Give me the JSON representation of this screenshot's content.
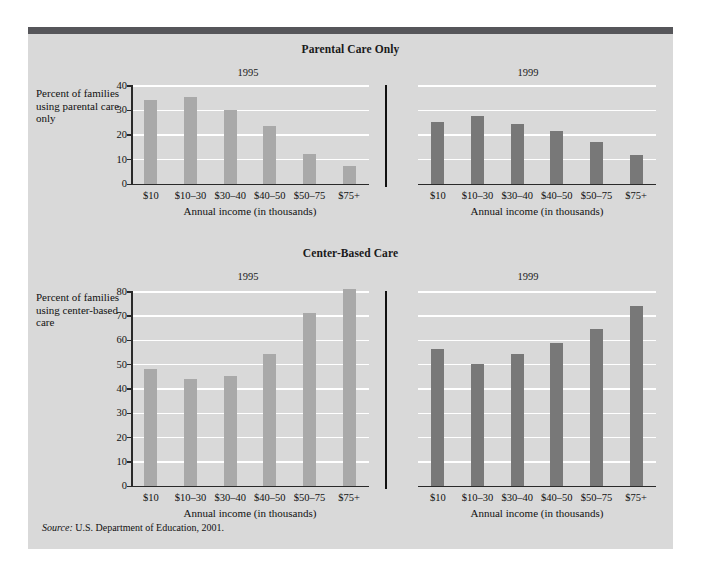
{
  "source": {
    "label": "Source:",
    "text": "U.S. Department of Education, 2001."
  },
  "chart_data": [
    {
      "type": "bar",
      "title": "Parental Care Only",
      "ylabel": "Percent of families using parental care only",
      "xlabel": "Annual income (in thousands)",
      "categories": [
        "$10",
        "$10–30",
        "$30–40",
        "$40–50",
        "$50–75",
        "$75+"
      ],
      "ylim": [
        0,
        40
      ],
      "yticks": [
        0,
        10,
        20,
        30,
        40
      ],
      "grid": true,
      "legend": "none",
      "panels": [
        {
          "name": "1995",
          "color": "#a9a9a9",
          "values": [
            34,
            35,
            30,
            23.5,
            12,
            7
          ]
        },
        {
          "name": "1999",
          "color": "#787878",
          "values": [
            25,
            27.5,
            24,
            21.5,
            17,
            11.5
          ]
        }
      ]
    },
    {
      "type": "bar",
      "title": "Center-Based Care",
      "ylabel": "Percent of families using center-based care",
      "xlabel": "Annual income (in thousands)",
      "categories": [
        "$10",
        "$10–30",
        "$30–40",
        "$40–50",
        "$50–75",
        "$75+"
      ],
      "ylim": [
        0,
        80
      ],
      "yticks": [
        0,
        10,
        20,
        30,
        40,
        50,
        60,
        70,
        80
      ],
      "grid": true,
      "legend": "none",
      "panels": [
        {
          "name": "1995",
          "color": "#a9a9a9",
          "values": [
            48,
            44,
            45,
            54,
            71,
            81
          ]
        },
        {
          "name": "1999",
          "color": "#787878",
          "values": [
            56,
            50,
            54,
            58.5,
            64.5,
            74
          ]
        }
      ]
    }
  ],
  "colors": {
    "panel_background": "#d9d9d9",
    "top_bar": "#56565a",
    "gridline": "#ffffff",
    "axis": "#2a2a2a",
    "bar_1995": "#a9a9a9",
    "bar_1999": "#787878"
  }
}
